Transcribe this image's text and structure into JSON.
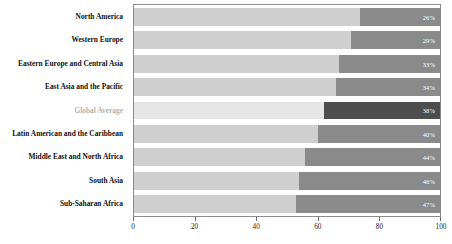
{
  "chart_data": {
    "type": "bar",
    "orientation": "horizontal",
    "stacked": true,
    "stacked_mode": "percent",
    "title": "",
    "subtitle": "",
    "xlabel": "",
    "ylabel": "",
    "xlim": [
      0,
      100
    ],
    "xticks": [
      0,
      20,
      40,
      60,
      80,
      100
    ],
    "xtick_labels": [
      "0",
      "20",
      "40",
      "60",
      "80",
      "100"
    ],
    "grid": false,
    "legend": null,
    "categories": [
      "North America",
      "Western Europe",
      "Eastern Europe and Central Asia",
      "East Asia and the Pacific",
      "Global Average",
      "Latin American and the Caribbean",
      "Middle East and North Africa",
      "South Asia",
      "Sub-Saharan Africa"
    ],
    "series": [
      {
        "name": "remainder",
        "values": [
          74,
          71,
          67,
          66,
          62,
          60,
          56,
          54,
          53
        ]
      },
      {
        "name": "highlighted share",
        "values": [
          26,
          29,
          33,
          34,
          38,
          40,
          44,
          46,
          47
        ]
      }
    ],
    "data_labels": [
      "26%",
      "29%",
      "33%",
      "34%",
      "38%",
      "40%",
      "44%",
      "46%",
      "47%"
    ],
    "highlight_index": 4,
    "colors": {
      "segment_left": "#cfcfcf",
      "segment_right": "#8a8a8a",
      "segment_left_highlight": "#e6e6e6",
      "segment_right_highlight": "#4d4d4d",
      "data_label_text": "#ffffff",
      "category_label": "#111111",
      "category_label_highlight": "#b3b3b3",
      "axis": "#8c8c8c",
      "background": "#ffffff"
    }
  }
}
